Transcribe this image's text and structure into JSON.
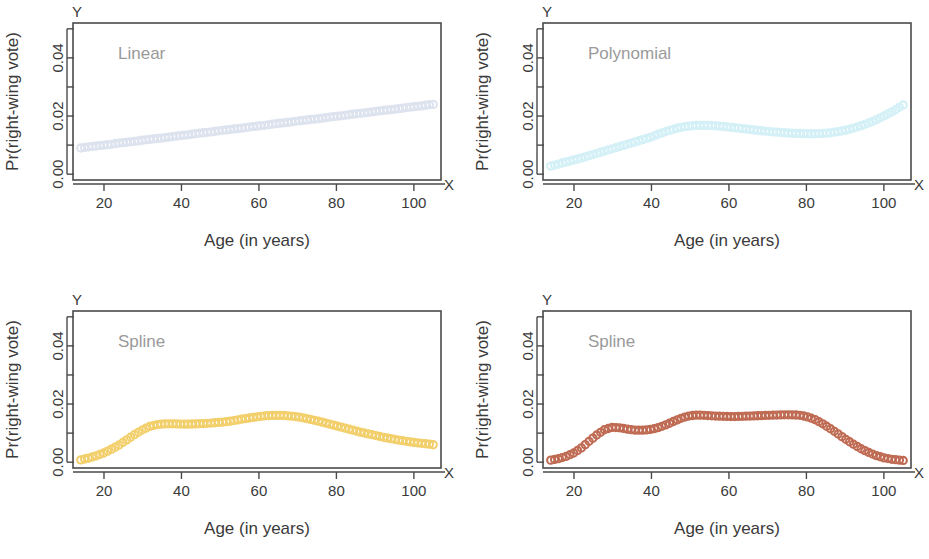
{
  "figure": {
    "panel_count": 4,
    "x_axis_title": "Age (in years)",
    "y_axis_title": "Pr(right-wing vote)",
    "x_axis_letter": "X",
    "y_axis_letter": "Y",
    "x_tick_labels": [
      "20",
      "40",
      "60",
      "80",
      "100"
    ],
    "y_tick_labels": [
      "0.00",
      "0.02",
      "0.04"
    ],
    "label_color": "#9a9a9a",
    "axis_color": "#4a4a4a"
  },
  "chart_data": [
    {
      "type": "scatter",
      "title": "Linear",
      "xlabel": "Age (in years)",
      "ylabel": "Pr(right-wing vote)",
      "xlim": [
        12,
        107
      ],
      "ylim": [
        -0.002,
        0.052
      ],
      "xticks": [
        20,
        40,
        60,
        80,
        100
      ],
      "yticks": [
        0.0,
        0.01,
        0.02,
        0.03,
        0.04,
        0.05
      ],
      "ytick_labels": [
        "0.00",
        "",
        "0.02",
        "",
        "0.04",
        ""
      ],
      "grid": false,
      "legend": "none",
      "marker": "open-circle",
      "color": "#dde3ee",
      "x": [
        14,
        16,
        18,
        20,
        22,
        24,
        26,
        28,
        30,
        32,
        34,
        36,
        38,
        40,
        42,
        44,
        46,
        48,
        50,
        52,
        54,
        56,
        58,
        60,
        62,
        64,
        66,
        68,
        70,
        72,
        74,
        76,
        78,
        80,
        82,
        84,
        86,
        88,
        90,
        92,
        94,
        96,
        98,
        100,
        102,
        104,
        105
      ],
      "y": [
        0.009,
        0.0094,
        0.0097,
        0.01,
        0.0103,
        0.0107,
        0.011,
        0.0113,
        0.0117,
        0.012,
        0.0123,
        0.0126,
        0.013,
        0.0133,
        0.0136,
        0.014,
        0.0143,
        0.0146,
        0.015,
        0.0153,
        0.0156,
        0.0159,
        0.0163,
        0.0166,
        0.0169,
        0.0173,
        0.0176,
        0.0179,
        0.0183,
        0.0186,
        0.0189,
        0.0192,
        0.0196,
        0.0199,
        0.0202,
        0.0206,
        0.0209,
        0.0212,
        0.0216,
        0.0219,
        0.0222,
        0.0225,
        0.0229,
        0.0232,
        0.0235,
        0.0239,
        0.024
      ]
    },
    {
      "type": "scatter",
      "title": "Polynomial",
      "xlabel": "Age (in years)",
      "ylabel": "Pr(right-wing vote)",
      "xlim": [
        12,
        107
      ],
      "ylim": [
        -0.002,
        0.052
      ],
      "xticks": [
        20,
        40,
        60,
        80,
        100
      ],
      "yticks": [
        0.0,
        0.01,
        0.02,
        0.03,
        0.04,
        0.05
      ],
      "ytick_labels": [
        "0.00",
        "",
        "0.02",
        "",
        "0.04",
        ""
      ],
      "grid": false,
      "legend": "none",
      "marker": "open-circle",
      "color": "#d4f0f7",
      "x": [
        14,
        16,
        18,
        20,
        22,
        24,
        26,
        28,
        30,
        32,
        34,
        36,
        38,
        40,
        42,
        44,
        46,
        48,
        50,
        52,
        54,
        56,
        58,
        60,
        62,
        64,
        66,
        68,
        70,
        72,
        74,
        76,
        78,
        80,
        82,
        84,
        86,
        88,
        90,
        92,
        94,
        96,
        98,
        100,
        102,
        104,
        105
      ],
      "y": [
        0.0028,
        0.0035,
        0.0042,
        0.0049,
        0.0056,
        0.0064,
        0.0072,
        0.008,
        0.0088,
        0.0096,
        0.0104,
        0.0112,
        0.012,
        0.0128,
        0.0139,
        0.0148,
        0.0156,
        0.0162,
        0.0166,
        0.0168,
        0.0168,
        0.0167,
        0.0165,
        0.0162,
        0.0159,
        0.0156,
        0.0153,
        0.015,
        0.0147,
        0.0145,
        0.0143,
        0.0141,
        0.014,
        0.0139,
        0.0139,
        0.014,
        0.0142,
        0.0146,
        0.0151,
        0.0158,
        0.0166,
        0.0176,
        0.0187,
        0.02,
        0.0214,
        0.023,
        0.0238
      ]
    },
    {
      "type": "scatter",
      "title": "Spline",
      "xlabel": "Age (in years)",
      "ylabel": "Pr(right-wing vote)",
      "xlim": [
        12,
        107
      ],
      "ylim": [
        -0.002,
        0.052
      ],
      "xticks": [
        20,
        40,
        60,
        80,
        100
      ],
      "yticks": [
        0.0,
        0.01,
        0.02,
        0.03,
        0.04,
        0.05
      ],
      "ytick_labels": [
        "0.00",
        "",
        "0.02",
        "",
        "0.04",
        ""
      ],
      "grid": false,
      "legend": "none",
      "marker": "open-circle",
      "color": "#f2cf6a",
      "x": [
        14,
        16,
        18,
        20,
        22,
        24,
        26,
        28,
        30,
        32,
        34,
        36,
        38,
        40,
        42,
        44,
        46,
        48,
        50,
        52,
        54,
        56,
        58,
        60,
        62,
        64,
        66,
        68,
        70,
        72,
        74,
        76,
        78,
        80,
        82,
        84,
        86,
        88,
        90,
        92,
        94,
        96,
        98,
        100,
        102,
        104,
        105
      ],
      "y": [
        0.0008,
        0.0014,
        0.0022,
        0.0032,
        0.0045,
        0.006,
        0.0078,
        0.0096,
        0.0112,
        0.0124,
        0.013,
        0.0132,
        0.0132,
        0.0131,
        0.0131,
        0.0132,
        0.0133,
        0.0135,
        0.0137,
        0.014,
        0.0144,
        0.0149,
        0.0153,
        0.0157,
        0.016,
        0.0161,
        0.0161,
        0.0159,
        0.0156,
        0.0151,
        0.0145,
        0.0139,
        0.0132,
        0.0125,
        0.0118,
        0.0111,
        0.0104,
        0.0098,
        0.0092,
        0.0086,
        0.0081,
        0.0076,
        0.0072,
        0.0068,
        0.0065,
        0.0062,
        0.006
      ]
    },
    {
      "type": "scatter",
      "title": "Spline",
      "xlabel": "Age (in years)",
      "ylabel": "Pr(right-wing vote)",
      "xlim": [
        12,
        107
      ],
      "ylim": [
        -0.002,
        0.052
      ],
      "xticks": [
        20,
        40,
        60,
        80,
        100
      ],
      "yticks": [
        0.0,
        0.01,
        0.02,
        0.03,
        0.04,
        0.05
      ],
      "ytick_labels": [
        "0.00",
        "",
        "0.02",
        "",
        "0.04",
        ""
      ],
      "grid": false,
      "legend": "none",
      "marker": "open-circle",
      "color": "#bf6a52",
      "x": [
        14,
        16,
        18,
        20,
        22,
        24,
        26,
        28,
        30,
        32,
        34,
        36,
        38,
        40,
        42,
        44,
        46,
        48,
        50,
        52,
        54,
        56,
        58,
        60,
        62,
        64,
        66,
        68,
        70,
        72,
        74,
        76,
        78,
        80,
        82,
        84,
        86,
        88,
        90,
        92,
        94,
        96,
        98,
        100,
        102,
        104,
        105
      ],
      "y": [
        0.0007,
        0.0012,
        0.002,
        0.0032,
        0.005,
        0.0073,
        0.0095,
        0.0113,
        0.012,
        0.0118,
        0.0113,
        0.011,
        0.011,
        0.0113,
        0.012,
        0.013,
        0.0142,
        0.0153,
        0.016,
        0.0162,
        0.0161,
        0.0159,
        0.0158,
        0.0157,
        0.0157,
        0.0158,
        0.0159,
        0.016,
        0.0161,
        0.0162,
        0.0163,
        0.0163,
        0.0162,
        0.0157,
        0.0148,
        0.0134,
        0.0117,
        0.0099,
        0.008,
        0.0063,
        0.0047,
        0.0034,
        0.0023,
        0.0015,
        0.001,
        0.0007,
        0.0006
      ]
    }
  ],
  "panels": [
    {
      "name": "linear",
      "index": 0
    },
    {
      "name": "polynomial",
      "index": 1
    },
    {
      "name": "spline-left",
      "index": 2
    },
    {
      "name": "spline-right",
      "index": 3
    }
  ]
}
